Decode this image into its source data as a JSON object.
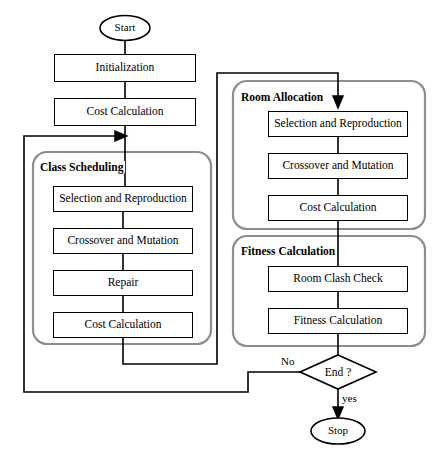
{
  "diagram": {
    "colors": {
      "stroke": "#000000",
      "group_stroke": "#8d8d8d",
      "background": "#ffffff"
    },
    "terminators": [
      {
        "id": "start",
        "label": "Start"
      },
      {
        "id": "stop",
        "label": "Stop"
      }
    ],
    "decision": {
      "id": "end",
      "label": "End ?"
    },
    "edge_labels": [
      {
        "id": "no",
        "label": "No"
      },
      {
        "id": "yes",
        "label": "yes"
      }
    ],
    "groups": [
      {
        "id": "class-scheduling",
        "label": "Class Scheduling"
      },
      {
        "id": "room-allocation",
        "label": "Room Allocation"
      },
      {
        "id": "fitness-calculation",
        "label": "Fitness Calculation"
      }
    ],
    "nodes": {
      "initialization": "Initialization",
      "cost_calculation": "Cost Calculation"
    },
    "class_scheduling_steps": [
      "Selection and Reproduction",
      "Crossover and Mutation",
      "Repair",
      "Cost Calculation"
    ],
    "room_allocation_steps": [
      "Selection and Reproduction",
      "Crossover and Mutation",
      "Cost Calculation"
    ],
    "fitness_calculation_steps": [
      "Room Clash Check",
      "Fitness Calculation"
    ]
  }
}
